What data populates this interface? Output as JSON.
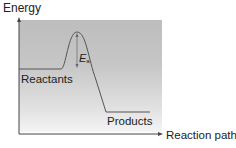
{
  "diagram": {
    "type": "energy-profile",
    "y_axis_label": "Energy",
    "x_axis_label": "Reaction path",
    "labels": {
      "reactants": "Reactants",
      "products": "Products",
      "activation_energy": "E",
      "activation_energy_subscript": "a"
    },
    "colors": {
      "curve": "#555555",
      "axes": "#444444",
      "box_top": "#bdbdbd",
      "box_bottom": "#f4f4f4"
    }
  }
}
